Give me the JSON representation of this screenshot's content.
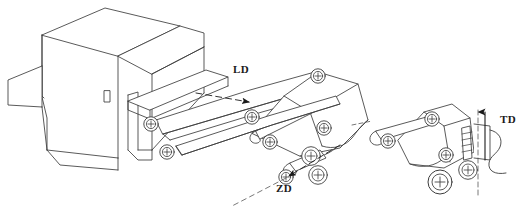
{
  "drawing": {
    "type": "isometric-line-drawing",
    "title": "Conveyor / folding unit isometric view",
    "background_color": "#ffffff",
    "line_color": "#3c3c3c",
    "label_color": "#1a1a1a",
    "width": 522,
    "height": 214
  },
  "labels": [
    {
      "id": "ld",
      "text": "LD",
      "meaning": "longitudinal direction indicator",
      "arrow": "dashed-arrow-right",
      "x": 233,
      "y": 63
    },
    {
      "id": "zd",
      "text": "ZD",
      "meaning": "feed direction indicator",
      "arrow": "dashed-arrow-left-down",
      "x": 276,
      "y": 182
    },
    {
      "id": "td",
      "text": "TD",
      "meaning": "transverse direction indicator",
      "arrow": "solid-arrow-up",
      "x": 500,
      "y": 113
    }
  ],
  "components": {
    "housing": "machine-housing-block",
    "upper_conveyor": "upper-conveyor-arm",
    "middle_conveyor": "middle-conveyor-arm",
    "lower_conveyor": "lower-conveyor-arm",
    "right_module": "right-roller-module",
    "web": "material-web-wavy-line",
    "centerline": "dashed-centerline",
    "roller_count": 14,
    "roller_style": "circle-with-crosshair"
  }
}
